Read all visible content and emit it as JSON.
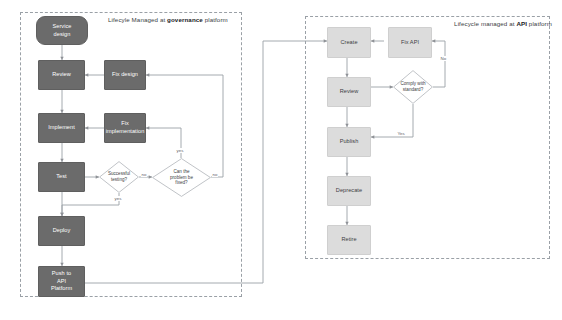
{
  "diagram": {
    "colors": {
      "governance_node_fill": "#6b6b6b",
      "governance_node_text": "#ffffff",
      "api_node_fill": "#dcdcdc",
      "api_node_text": "#3c4043",
      "panel_border": "#9aa0a6",
      "connector": "#9aa0a6",
      "background": "#ffffff"
    }
  },
  "panels": [
    {
      "id": "governance",
      "title_prefix": "Lifecyle Managed at ",
      "title_emphasis": "governance",
      "title_suffix": " platform"
    },
    {
      "id": "api",
      "title_prefix": "Lifecycle managed at ",
      "title_emphasis": "API",
      "title_suffix": " platform"
    }
  ],
  "governance_flow": {
    "nodes": [
      {
        "id": "service-design",
        "label": "Service\ndesign",
        "shape": "rounded"
      },
      {
        "id": "review",
        "label": "Review",
        "shape": "rect"
      },
      {
        "id": "fix-design",
        "label": "Fix design",
        "shape": "rect"
      },
      {
        "id": "implement",
        "label": "Implement",
        "shape": "rect"
      },
      {
        "id": "fix-implementation",
        "label": "Fix\nimplementation",
        "shape": "rect"
      },
      {
        "id": "test",
        "label": "Test",
        "shape": "rect"
      },
      {
        "id": "successful-testing",
        "label": "Successful\ntesting?",
        "shape": "diamond"
      },
      {
        "id": "can-problem-be-fixed",
        "label": "Can the\nproblem be\nfixed?",
        "shape": "diamond"
      },
      {
        "id": "deploy",
        "label": "Deploy",
        "shape": "rect"
      },
      {
        "id": "push-to-api-platform",
        "label": "Push to\nAPI\nPlatform",
        "shape": "rect"
      }
    ],
    "edge_labels": {
      "testing_no": "no",
      "testing_yes": "yes",
      "fixable_yes": "yes",
      "fixable_no": "no"
    }
  },
  "api_flow": {
    "nodes": [
      {
        "id": "create",
        "label": "Create",
        "shape": "rect"
      },
      {
        "id": "fix-api",
        "label": "Fix API",
        "shape": "rect"
      },
      {
        "id": "review-api",
        "label": "Review",
        "shape": "rect"
      },
      {
        "id": "comply-with-standard",
        "label": "Comply with\nstandard?",
        "shape": "diamond"
      },
      {
        "id": "publish",
        "label": "Publish",
        "shape": "rect"
      },
      {
        "id": "deprecate",
        "label": "Deprecate",
        "shape": "rect"
      },
      {
        "id": "retire",
        "label": "Retire",
        "shape": "rect"
      }
    ],
    "edge_labels": {
      "comply_no": "No",
      "comply_yes": "Yes"
    }
  }
}
